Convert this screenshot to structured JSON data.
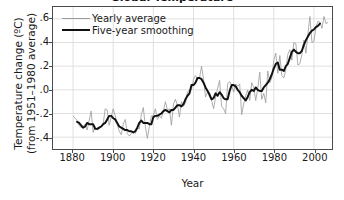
{
  "chart_data": {
    "type": "line",
    "title": "Global Temperature",
    "xlabel": "Year",
    "ylabel_line1": "Temperature change   (ºC)",
    "ylabel_line2": "(from 1951–1980 average)",
    "xlim": [
      1870,
      2009
    ],
    "ylim": [
      -0.5,
      0.7
    ],
    "grid": true,
    "legend_position": "top-left",
    "xticks": [
      1880,
      1900,
      1920,
      1940,
      1960,
      1980,
      2000
    ],
    "xtick_labels": [
      "1880",
      "1900",
      "1920",
      "1940",
      "1960",
      "1980",
      "2000"
    ],
    "yticks": [
      0.6,
      0.4,
      0.2,
      0.0,
      -0.2,
      -0.4
    ],
    "ytick_labels": [
      ".6",
      ".4",
      ".2",
      ".0",
      "-.2",
      "-.4"
    ],
    "colors": {
      "yearly": "#9a9a9a",
      "smoothed": "#111111",
      "grid": "#d8d8d8",
      "frame": "#4b4b4b"
    },
    "x": [
      1880,
      1881,
      1882,
      1883,
      1884,
      1885,
      1886,
      1887,
      1888,
      1889,
      1890,
      1891,
      1892,
      1893,
      1894,
      1895,
      1896,
      1897,
      1898,
      1899,
      1900,
      1901,
      1902,
      1903,
      1904,
      1905,
      1906,
      1907,
      1908,
      1909,
      1910,
      1911,
      1912,
      1913,
      1914,
      1915,
      1916,
      1917,
      1918,
      1919,
      1920,
      1921,
      1922,
      1923,
      1924,
      1925,
      1926,
      1927,
      1928,
      1929,
      1930,
      1931,
      1932,
      1933,
      1934,
      1935,
      1936,
      1937,
      1938,
      1939,
      1940,
      1941,
      1942,
      1943,
      1944,
      1945,
      1946,
      1947,
      1948,
      1949,
      1950,
      1951,
      1952,
      1953,
      1954,
      1955,
      1956,
      1957,
      1958,
      1959,
      1960,
      1961,
      1962,
      1963,
      1964,
      1965,
      1966,
      1967,
      1968,
      1969,
      1970,
      1971,
      1972,
      1973,
      1974,
      1975,
      1976,
      1977,
      1978,
      1979,
      1980,
      1981,
      1982,
      1983,
      1984,
      1985,
      1986,
      1987,
      1988,
      1989,
      1990,
      1991,
      1992,
      1993,
      1994,
      1995,
      1996,
      1997,
      1998,
      1999,
      2000,
      2001,
      2002,
      2003,
      2004,
      2005,
      2006,
      2007
    ],
    "series": [
      {
        "name": "Yearly average",
        "style": "thin-gray",
        "values": [
          -0.22,
          -0.24,
          -0.26,
          -0.3,
          -0.32,
          -0.31,
          -0.29,
          -0.34,
          -0.26,
          -0.18,
          -0.36,
          -0.31,
          -0.34,
          -0.33,
          -0.31,
          -0.29,
          -0.16,
          -0.17,
          -0.3,
          -0.23,
          -0.16,
          -0.22,
          -0.29,
          -0.35,
          -0.38,
          -0.29,
          -0.25,
          -0.37,
          -0.39,
          -0.37,
          -0.35,
          -0.37,
          -0.32,
          -0.33,
          -0.21,
          -0.15,
          -0.31,
          -0.41,
          -0.31,
          -0.22,
          -0.22,
          -0.16,
          -0.25,
          -0.22,
          -0.24,
          -0.18,
          -0.1,
          -0.17,
          -0.16,
          -0.3,
          -0.12,
          -0.08,
          -0.13,
          -0.23,
          -0.1,
          -0.14,
          -0.11,
          -0.02,
          0.0,
          0.0,
          0.09,
          0.12,
          0.09,
          0.1,
          0.2,
          0.09,
          -0.06,
          -0.02,
          -0.06,
          -0.09,
          -0.16,
          -0.06,
          0.01,
          0.08,
          -0.14,
          -0.16,
          -0.2,
          0.05,
          0.07,
          0.04,
          -0.02,
          0.05,
          0.03,
          0.05,
          -0.21,
          -0.12,
          -0.05,
          0.0,
          -0.09,
          0.06,
          0.02,
          -0.09,
          0.01,
          0.15,
          -0.08,
          -0.03,
          -0.11,
          0.16,
          0.06,
          0.1,
          0.25,
          0.31,
          0.14,
          0.29,
          0.12,
          0.1,
          0.17,
          0.3,
          0.34,
          0.25,
          0.4,
          0.39,
          0.21,
          0.22,
          0.3,
          0.42,
          0.31,
          0.47,
          0.62,
          0.4,
          0.41,
          0.53,
          0.58,
          0.57,
          0.52,
          0.62,
          0.56,
          0.57
        ]
      },
      {
        "name": "Five-year smoothing",
        "style": "thick-black",
        "values": [
          null,
          null,
          -0.27,
          -0.28,
          -0.3,
          -0.32,
          -0.31,
          -0.28,
          -0.29,
          -0.29,
          -0.29,
          -0.33,
          -0.33,
          -0.32,
          -0.31,
          -0.29,
          -0.28,
          -0.25,
          -0.22,
          -0.22,
          -0.24,
          -0.25,
          -0.28,
          -0.31,
          -0.32,
          -0.33,
          -0.34,
          -0.34,
          -0.35,
          -0.35,
          -0.36,
          -0.35,
          -0.32,
          -0.28,
          -0.26,
          -0.28,
          -0.28,
          -0.28,
          -0.29,
          -0.29,
          -0.23,
          -0.22,
          -0.22,
          -0.21,
          -0.2,
          -0.18,
          -0.17,
          -0.18,
          -0.19,
          -0.17,
          -0.17,
          -0.15,
          -0.13,
          -0.13,
          -0.14,
          -0.12,
          -0.08,
          -0.05,
          -0.03,
          0.04,
          0.04,
          0.06,
          0.1,
          0.1,
          0.09,
          0.06,
          0.02,
          -0.01,
          -0.04,
          -0.08,
          -0.07,
          -0.03,
          -0.05,
          -0.02,
          -0.04,
          -0.07,
          -0.08,
          -0.08,
          -0.01,
          0.04,
          0.04,
          0.03,
          0.0,
          -0.02,
          -0.05,
          -0.07,
          -0.09,
          -0.06,
          -0.02,
          0.0,
          -0.01,
          0.02,
          0.0,
          -0.01,
          -0.01,
          0.02,
          0.04,
          0.06,
          0.09,
          0.13,
          0.18,
          0.22,
          0.23,
          0.17,
          0.17,
          0.16,
          0.2,
          0.22,
          0.27,
          0.32,
          0.34,
          0.32,
          0.31,
          0.31,
          0.33,
          0.38,
          0.42,
          0.45,
          0.48,
          0.5,
          0.51,
          0.53,
          0.54,
          0.56,
          null,
          null,
          null,
          null
        ]
      }
    ]
  },
  "legend": {
    "items": [
      {
        "label": "Yearly average"
      },
      {
        "label": "Five-year smoothing"
      }
    ]
  }
}
